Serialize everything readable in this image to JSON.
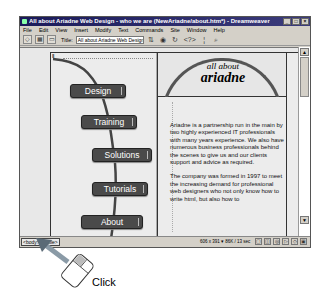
{
  "window": {
    "title": "All about Ariadne Web Design - who we are (NewAriadne/about.htm*) - Dreamweaver",
    "controls": [
      "_",
      "□",
      "×"
    ]
  },
  "menubar": {
    "items": [
      "File",
      "Edit",
      "View",
      "Insert",
      "Modify",
      "Text",
      "Commands",
      "Site",
      "Window",
      "Help"
    ]
  },
  "toolbar": {
    "view_buttons": [
      "code-view",
      "split-view",
      "design-view"
    ],
    "view_glyphs": [
      "◇",
      "▦",
      "▭"
    ],
    "title_label": "Title:",
    "title_value": "All about Ariadne Web Design - w",
    "icons": [
      "file-management",
      "preview-in-browser",
      "refresh",
      "code-navigation",
      "view-options",
      "zoom"
    ],
    "icon_glyphs": [
      "⇅",
      "◉",
      "↻",
      "<?>",
      "¦",
      "⌕"
    ]
  },
  "page": {
    "tag_marker": "Ⅱ",
    "nav": [
      "Design",
      "Training",
      "Solutions",
      "Tutorials",
      "About"
    ],
    "header": {
      "line1": "all about",
      "line2": "ariadne"
    },
    "paragraphs": [
      "Ariadne is a partnership run in the main by two highly experienced IT professionals with many years experience. We also have numerous business professionals behind the scenes to give us and our clients support and advice as required.",
      "The company was formed in 1997 to meet the increasing demand for professional web designers who not only know how to write html, but also how to"
    ]
  },
  "scrollbar": {
    "up": "▲",
    "down": "▼"
  },
  "statusbar": {
    "tag_selector": "<body> <table>",
    "info": "606 x 391 ▾ 86K / 13 sec",
    "icons": [
      "site",
      "assets",
      "html-styles",
      "css-styles",
      "behaviors",
      "history"
    ],
    "icon_glyphs": [
      "▢",
      "◫",
      "◎",
      "▷",
      "◇",
      "▣"
    ]
  },
  "annotation": {
    "label": "Click"
  }
}
